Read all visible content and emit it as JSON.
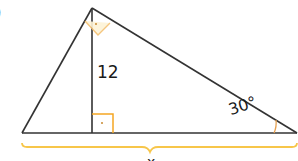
{
  "diagram": {
    "type": "right-triangle-with-altitude",
    "part_label": ")",
    "labels": {
      "altitude": "12",
      "angle": "30°",
      "base": "x"
    },
    "colors": {
      "stroke": "#333333",
      "marker": "#f5a623",
      "brace": "#f7c64a"
    },
    "markers": [
      {
        "kind": "right-angle",
        "at": "apex"
      },
      {
        "kind": "right-angle",
        "at": "altitude-foot"
      },
      {
        "kind": "angle-arc",
        "at": "right-vertex",
        "value": "30°"
      }
    ]
  }
}
